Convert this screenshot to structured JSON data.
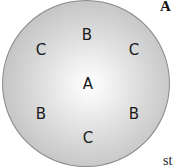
{
  "figure": {
    "panel_label": "A",
    "truncated_caption_fragment": "st",
    "plate": {
      "description": "circular plate with radial gradient, lightest at center",
      "center_color": "#ffffff",
      "edge_color": "#b5b5b5",
      "border_color": "#8a8a8a"
    },
    "zones": [
      {
        "label": "B",
        "position": "top"
      },
      {
        "label": "C",
        "position": "upper-left"
      },
      {
        "label": "C",
        "position": "upper-right"
      },
      {
        "label": "A",
        "position": "center"
      },
      {
        "label": "B",
        "position": "lower-left"
      },
      {
        "label": "B",
        "position": "lower-right"
      },
      {
        "label": "C",
        "position": "bottom"
      }
    ]
  }
}
